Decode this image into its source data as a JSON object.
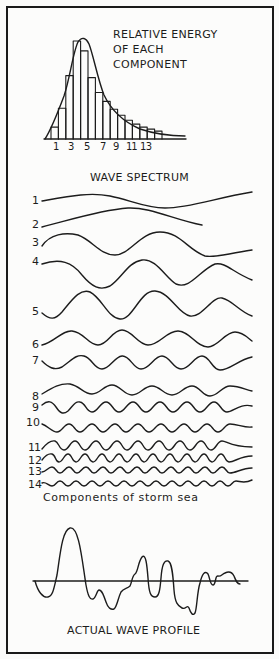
{
  "energy_chart": {
    "title_lines": [
      "RELATIVE ENERGY",
      "OF EACH",
      "COMPONENT"
    ],
    "tick_labels": [
      "1",
      "3",
      "5",
      "7",
      "9",
      "11",
      "13"
    ],
    "caption": "WAVE SPECTRUM"
  },
  "components": {
    "labels": [
      "1",
      "2",
      "3",
      "4",
      "5",
      "6",
      "7",
      "8",
      "9",
      "10",
      "11",
      "12",
      "13",
      "14"
    ],
    "caption": "Components of storm sea"
  },
  "profile": {
    "caption": "ACTUAL WAVE PROFILE"
  },
  "colors": {
    "ink": "#1c1c1c",
    "paper": "#fcfcfb"
  },
  "chart_data": {
    "type": "bar",
    "title": "RELATIVE ENERGY OF EACH COMPONENT",
    "xlabel": "WAVE SPECTRUM",
    "ylabel": "",
    "categories": [
      "1",
      "2",
      "3",
      "4",
      "5",
      "6",
      "7",
      "8",
      "9",
      "10",
      "11",
      "12",
      "13",
      "14",
      "15"
    ],
    "values": [
      12,
      31,
      64,
      99,
      89,
      62,
      47,
      38,
      30,
      24,
      19,
      15,
      12,
      10,
      8
    ],
    "tick_labels": [
      "1",
      "3",
      "5",
      "7",
      "9",
      "11",
      "13"
    ],
    "envelope_curve": true,
    "grid": false,
    "units": "relative energy (peak = 100, estimated)"
  }
}
